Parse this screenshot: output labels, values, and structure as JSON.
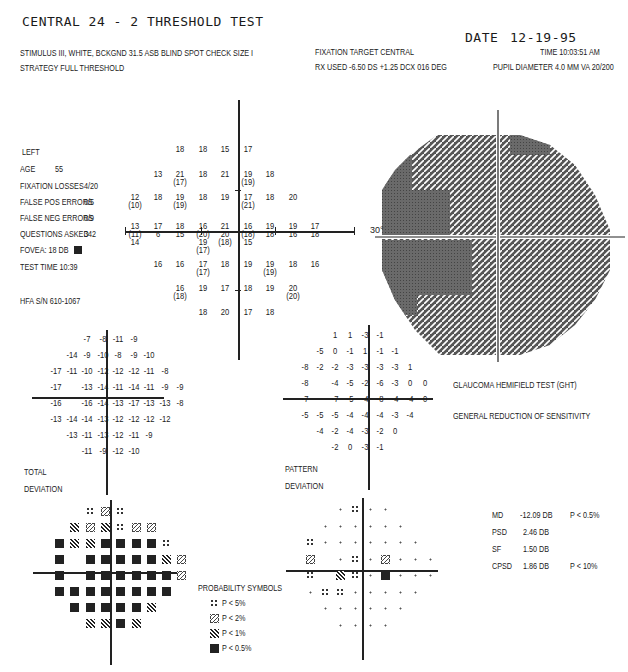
{
  "header": {
    "title": "CENTRAL 24 - 2 THRESHOLD TEST",
    "date_label": "DATE",
    "date": "12-19-95",
    "stimulus": "STIMULUS  III, WHITE, BCKGND 31.5 ASB  BLIND SPOT CHECK SIZE  I",
    "strategy": "STRATEGY  FULL THRESHOLD",
    "fixation_target": "FIXATION TARGET   CENTRAL",
    "rx_used": "RX USED -6.50 DS +1.25 DCX 016 DEG",
    "time": "TIME  10:03:51 AM",
    "pupil": "PUPIL DIAMETER 4.0 MM   VA  20/200"
  },
  "patient": {
    "eye": "LEFT",
    "age_label": "AGE",
    "age": "55",
    "fixation_losses_label": "FIXATION LOSSES",
    "fixation_losses": "4/20",
    "false_pos_label": "FALSE POS ERRORS",
    "false_pos": "0/5",
    "false_neg_label": "FALSE NEG ERRORS",
    "false_neg": "0/9",
    "questions_label": "QUESTIONS ASKED",
    "questions": "342",
    "fovea": "FOVEA:  18 DB",
    "test_time": "TEST TIME 10:39",
    "hfa_sn": "HFA S/N   610-1067"
  },
  "threshold_map": {
    "rows": [
      [
        null,
        null,
        "18",
        "18",
        "15",
        "17",
        null,
        null,
        null
      ],
      [
        null,
        "13",
        "21|(17)",
        "18",
        "21",
        "19|(19)",
        "18",
        null,
        null
      ],
      [
        "12|(10)",
        "18",
        "19|(19)",
        "18",
        "19",
        "17|(21)",
        "18",
        "20",
        null
      ],
      [
        "13|(11)|14",
        "17|6",
        "18|15",
        "16|(20)|19|(17)",
        "21|20|(18)",
        "16|(18)|15",
        "19|18",
        "19|16",
        "17|18"
      ],
      [
        null,
        "16",
        "16",
        "17|(17)",
        "18",
        "19",
        "19|(19)",
        "18",
        "16"
      ],
      [
        null,
        null,
        "16|(18)",
        "19",
        "17",
        "18",
        "19",
        "20|(20)",
        null
      ],
      [
        null,
        null,
        null,
        "18",
        "20",
        "17",
        "18",
        null,
        null
      ]
    ],
    "axis_label": "30°"
  },
  "total_deviation": {
    "label_line1": "TOTAL",
    "label_line2": "DEVIATION",
    "rows": [
      [
        null,
        null,
        "-7",
        "-8",
        "-11",
        "-9",
        null,
        null,
        null
      ],
      [
        null,
        "-14",
        "-9",
        "-10",
        "-8",
        "-9",
        "-10",
        null,
        null
      ],
      [
        "-17",
        "-11",
        "-10",
        "-12",
        "-12",
        "-12",
        "-11",
        "-8",
        null
      ],
      [
        "-17",
        null,
        "-13",
        "-14",
        "-11",
        "-14",
        "-11",
        "-9",
        "-9"
      ],
      [
        "-16",
        null,
        "-16",
        "-14",
        "-13",
        "-17",
        "-13",
        "-13",
        "-8"
      ],
      [
        "-13",
        "-14",
        "-14",
        "-13",
        "-12",
        "-12",
        "-12",
        "-12",
        null
      ],
      [
        null,
        "-13",
        "-11",
        "-13",
        "-12",
        "-11",
        "-9",
        null,
        null
      ],
      [
        null,
        null,
        "-11",
        "-9",
        "-12",
        "-10",
        null,
        null,
        null
      ]
    ],
    "prob_rows": [
      [
        null,
        null,
        "5",
        "2",
        "5",
        null,
        null,
        null,
        null
      ],
      [
        null,
        "1",
        "2",
        "1",
        "5",
        "2",
        "2",
        null,
        null
      ],
      [
        "0.5",
        "1",
        "1",
        "0.5",
        "0.5",
        "0.5",
        "0.5",
        "5",
        null
      ],
      [
        "0.5",
        null,
        "0.5",
        "0.5",
        "0.5",
        "0.5",
        "0.5",
        "1",
        "2"
      ],
      [
        "0.5",
        null,
        "0.5",
        "0.5",
        "0.5",
        "0.5",
        "0.5",
        "0.5",
        "2"
      ],
      [
        "0.5",
        "0.5",
        "0.5",
        "0.5",
        "0.5",
        "0.5",
        "0.5",
        "0.5",
        null
      ],
      [
        null,
        "0.5",
        "0.5",
        "0.5",
        "0.5",
        "0.5",
        "1",
        null,
        null
      ],
      [
        null,
        null,
        "1",
        "1",
        "0.5",
        "1",
        null,
        null,
        null
      ]
    ]
  },
  "pattern_deviation": {
    "label_line1": "PATTERN",
    "label_line2": "DEVIATION",
    "rows": [
      [
        null,
        null,
        "1",
        "1",
        "-3",
        "-1",
        null,
        null,
        null
      ],
      [
        null,
        "-5",
        "0",
        "-1",
        "1",
        "-1",
        "-1",
        null,
        null
      ],
      [
        "-8",
        "-2",
        "-2",
        "-3",
        "-3",
        "-3",
        "-3",
        "1",
        null
      ],
      [
        "-8",
        null,
        "-4",
        "-5",
        "-2",
        "-6",
        "-3",
        "0",
        "0"
      ],
      [
        "-7",
        null,
        "-7",
        "-5",
        "-4",
        "-8",
        "-4",
        "-4",
        "0"
      ],
      [
        "-5",
        "-5",
        "-5",
        "-4",
        "-4",
        "-4",
        "-3",
        "-4",
        null
      ],
      [
        null,
        "-4",
        "-2",
        "-4",
        "-3",
        "-2",
        "0",
        null,
        null
      ],
      [
        null,
        null,
        "-2",
        "0",
        "-3",
        "-1",
        null,
        null,
        null
      ]
    ],
    "prob_rows": [
      [
        null,
        null,
        "n",
        "5",
        "n",
        "n",
        null,
        null,
        null
      ],
      [
        null,
        "n",
        "n",
        "n",
        "n",
        "n",
        "n",
        null,
        null
      ],
      [
        "5",
        "n",
        "n",
        "n",
        "n",
        "n",
        "n",
        "n",
        null
      ],
      [
        "2",
        null,
        "n",
        "5",
        "n",
        "2",
        "n",
        "n",
        "n"
      ],
      [
        "5",
        null,
        "1",
        "5",
        "n",
        "0.5",
        "n",
        "n",
        "n"
      ],
      [
        "n",
        "5",
        "5",
        "n",
        "n",
        "n",
        "n",
        "n",
        null
      ],
      [
        null,
        "n",
        "n",
        "n",
        "n",
        "n",
        "n",
        null,
        null
      ],
      [
        null,
        null,
        "n",
        "n",
        "n",
        "n",
        null,
        null,
        null
      ]
    ]
  },
  "ght": {
    "label": "GLAUCOMA HEMIFIELD TEST (GHT)",
    "result": "GENERAL REDUCTION OF SENSITIVITY"
  },
  "global_indices": [
    {
      "label": "MD",
      "value": "-12.09 DB",
      "p": "P < 0.5%"
    },
    {
      "label": "PSD",
      "value": "2.46 DB",
      "p": ""
    },
    {
      "label": "SF",
      "value": "1.50 DB",
      "p": ""
    },
    {
      "label": "CPSD",
      "value": "1.86 DB",
      "p": "P < 10%"
    }
  ],
  "probability_symbols": {
    "title": "PROBABILITY SYMBOLS",
    "items": [
      {
        "sym": "5",
        "label": "P <  5%"
      },
      {
        "sym": "2",
        "label": "P <  2%"
      },
      {
        "sym": "1",
        "label": "P <  1%"
      },
      {
        "sym": "0.5",
        "label": "P < 0.5%"
      }
    ]
  }
}
